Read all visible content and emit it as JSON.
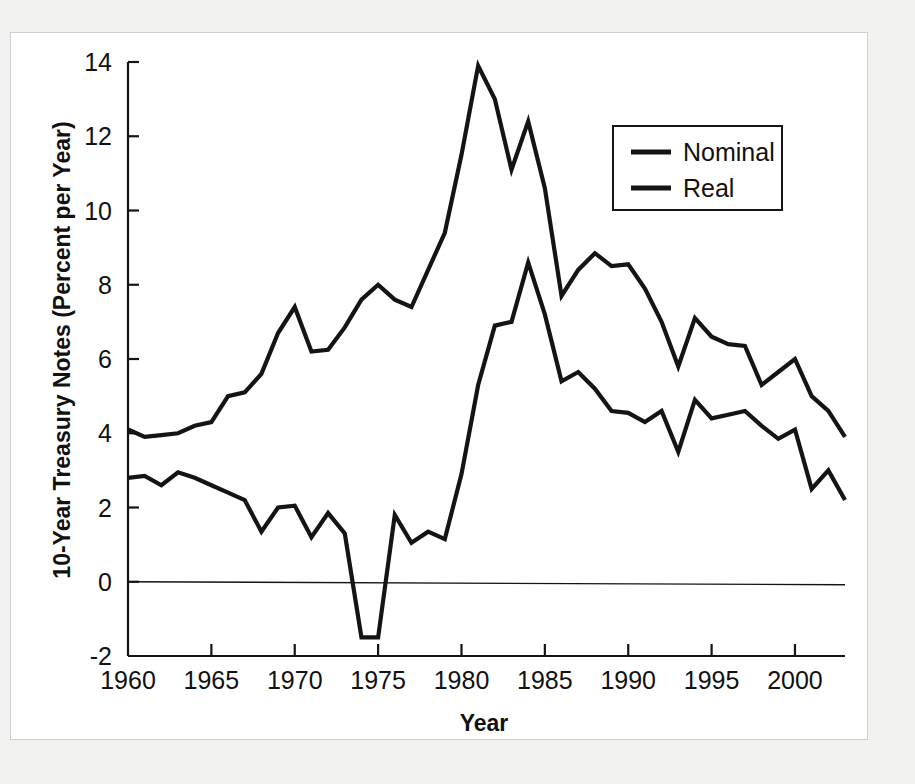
{
  "figure": {
    "background_color": "#f2f2f0",
    "plot_background_color": "#ffffff",
    "line_color": "#141414",
    "frame_color": "#cfcfcf"
  },
  "chart_data": {
    "type": "line",
    "title": "",
    "xlabel": "Year",
    "ylabel": "10-Year Treasury Notes (Percent per Year)",
    "xlim": [
      1960,
      2003
    ],
    "ylim": [
      -2,
      14
    ],
    "xticks": [
      1960,
      1965,
      1970,
      1975,
      1980,
      1985,
      1990,
      1995,
      2000
    ],
    "xtick_labels": [
      "1960",
      "1965",
      "1970",
      "1975",
      "1980",
      "1985",
      "1990",
      "1995",
      "2000"
    ],
    "yticks": [
      -2,
      0,
      2,
      4,
      6,
      8,
      10,
      12,
      14
    ],
    "ytick_labels": [
      "-2",
      "0",
      "2",
      "4",
      "6",
      "8",
      "10",
      "12",
      "14"
    ],
    "grid": false,
    "zero_line": true,
    "legend_position": "upper-right",
    "x": [
      1960,
      1961,
      1962,
      1963,
      1964,
      1965,
      1966,
      1967,
      1968,
      1969,
      1970,
      1971,
      1972,
      1973,
      1974,
      1975,
      1976,
      1977,
      1978,
      1979,
      1980,
      1981,
      1982,
      1983,
      1984,
      1985,
      1986,
      1987,
      1988,
      1989,
      1990,
      1991,
      1992,
      1993,
      1994,
      1995,
      1996,
      1997,
      1998,
      1999,
      2000,
      2001,
      2002,
      2003
    ],
    "series": [
      {
        "name": "Nominal",
        "color": "#141414",
        "values": [
          4.1,
          3.9,
          3.95,
          4.0,
          4.2,
          4.3,
          5.0,
          5.1,
          5.6,
          6.7,
          7.4,
          6.2,
          6.25,
          6.85,
          7.6,
          8.0,
          7.6,
          7.4,
          8.4,
          9.4,
          11.5,
          13.9,
          13.0,
          11.1,
          12.4,
          10.6,
          7.7,
          8.4,
          8.85,
          8.5,
          8.55,
          7.9,
          7.0,
          5.8,
          7.1,
          6.6,
          6.4,
          6.35,
          5.3,
          5.65,
          6.0,
          5.0,
          4.6,
          3.9
        ]
      },
      {
        "name": "Real",
        "color": "#141414",
        "values": [
          2.8,
          2.85,
          2.6,
          2.95,
          2.8,
          2.6,
          2.4,
          2.2,
          1.35,
          2.0,
          2.05,
          1.2,
          1.85,
          1.3,
          -1.5,
          -1.5,
          1.8,
          1.05,
          1.35,
          1.15,
          2.9,
          5.3,
          6.9,
          7.0,
          8.6,
          7.2,
          5.4,
          5.65,
          5.2,
          4.6,
          4.55,
          4.3,
          4.6,
          3.5,
          4.9,
          4.4,
          4.5,
          4.6,
          4.2,
          3.85,
          4.1,
          2.5,
          3.0,
          2.2
        ]
      }
    ]
  },
  "legend": {
    "entries": [
      {
        "label": "Nominal",
        "color": "#141414"
      },
      {
        "label": "Real",
        "color": "#141414"
      }
    ]
  },
  "axes": {
    "x_title": "Year",
    "y_title": "10-Year Treasury Notes (Percent per Year)"
  }
}
